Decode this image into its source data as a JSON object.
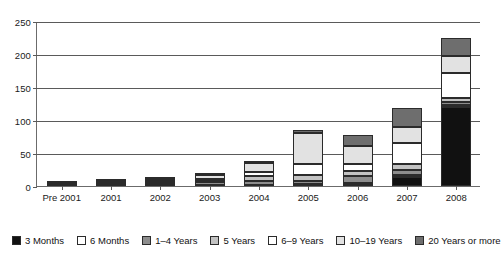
{
  "chart_data": {
    "type": "bar",
    "subtype": "stacked-vertical",
    "title": "",
    "subtitle": "",
    "xlabel": "",
    "ylabel": "",
    "ylim": [
      0,
      250
    ],
    "yticks": [
      0,
      50,
      100,
      150,
      200,
      250
    ],
    "grid": true,
    "legend_position": "bottom",
    "categories": [
      "Pre 2001",
      "2001",
      "2002",
      "2003",
      "2004",
      "2005",
      "2006",
      "2007",
      "2008"
    ],
    "series": [
      {
        "name": "3 Months",
        "color": "#111111",
        "values": [
          0,
          0,
          1,
          1,
          1,
          2,
          3,
          14,
          120
        ]
      },
      {
        "name": "6 Months",
        "color": "#ffffff",
        "values": [
          0,
          0,
          1,
          1,
          1,
          1,
          1,
          2,
          2
        ]
      },
      {
        "name": "1–4 Years",
        "color": "#8d8d8d",
        "values": [
          1,
          1,
          2,
          4,
          5,
          5,
          11,
          8,
          6
        ]
      },
      {
        "name": "5 Years",
        "color": "#c2c2c2",
        "values": [
          1,
          2,
          2,
          2,
          8,
          9,
          8,
          10,
          5
        ]
      },
      {
        "name": "6–9 Years",
        "color": "#ffffff",
        "values": [
          1,
          2,
          2,
          3,
          6,
          17,
          10,
          31,
          38
        ]
      },
      {
        "name": "10–19 Years",
        "color": "#e2e2e2",
        "values": [
          1,
          2,
          3,
          5,
          14,
          47,
          27,
          25,
          26
        ]
      },
      {
        "name": "20 Years or more",
        "color": "#6e6e6e",
        "values": [
          1,
          1,
          1,
          2,
          3,
          4,
          18,
          28,
          28
        ]
      }
    ],
    "totals": [
      5,
      8,
      12,
      18,
      38,
      85,
      78,
      118,
      225
    ]
  },
  "axes": {
    "y_tick_labels": [
      "250",
      "200",
      "150",
      "100",
      "50",
      "0"
    ],
    "x_tick_labels": [
      "Pre 2001",
      "2001",
      "2002",
      "2003",
      "2004",
      "2005",
      "2006",
      "2007",
      "2008"
    ]
  },
  "legend": {
    "items": [
      {
        "label": "3 Months",
        "color": "#111111"
      },
      {
        "label": "6 Months",
        "color": "#ffffff"
      },
      {
        "label": "1–4 Years",
        "color": "#8d8d8d"
      },
      {
        "label": "5 Years",
        "color": "#c2c2c2"
      },
      {
        "label": "6–9 Years",
        "color": "#ffffff"
      },
      {
        "label": "10–19 Years",
        "color": "#e2e2e2"
      },
      {
        "label": "20 Years or more",
        "color": "#6e6e6e"
      }
    ]
  },
  "colors": {
    "axis": "#5a5a5a",
    "grid": "#5a5a5a",
    "text": "#1a1a1a",
    "background": "#ffffff",
    "segment_border": "#2b2b2b"
  }
}
